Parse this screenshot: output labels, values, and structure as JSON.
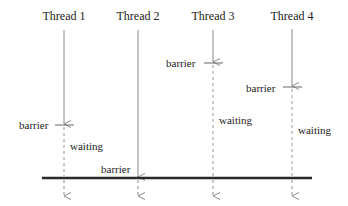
{
  "diagram": {
    "type": "barrier-synchronization",
    "threads": [
      {
        "label": "Thread 1",
        "x": 64,
        "barrier_y": 125,
        "barrier_label": "barrier",
        "waiting_label": "waiting",
        "has_waiting": true
      },
      {
        "label": "Thread 2",
        "x": 138,
        "barrier_y": 178,
        "barrier_label": "barrier",
        "waiting_label": "",
        "has_waiting": false
      },
      {
        "label": "Thread 3",
        "x": 213,
        "barrier_y": 63,
        "barrier_label": "barrier",
        "waiting_label": "waiting",
        "has_waiting": true
      },
      {
        "label": "Thread 4",
        "x": 292,
        "barrier_y": 87,
        "barrier_label": "barrier",
        "waiting_label": "waiting",
        "has_waiting": true
      }
    ],
    "sync_line": {
      "y": 178,
      "x1": 42,
      "x2": 312
    },
    "colors": {
      "line": "#8a8a8a",
      "sync_line": "#2a2a2a",
      "text": "#222222"
    }
  }
}
